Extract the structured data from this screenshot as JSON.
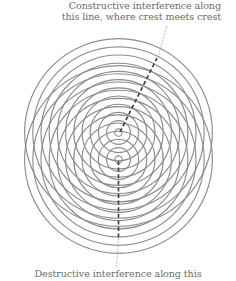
{
  "annotations": {
    "constructive": {
      "lines": [
        "Constructive interference along",
        "this line, where crest meets crest"
      ]
    },
    "destructive": {
      "lines": [
        "Destructive interference along this"
      ]
    }
  },
  "diagram": {
    "type": "two-source interference pattern",
    "sources": [
      {
        "name": "upper-source",
        "cx": 118.5,
        "cy": 132.5
      },
      {
        "name": "lower-source",
        "cx": 118.5,
        "cy": 159.5
      }
    ],
    "ring_count": 12,
    "ring_spacing": 8.2,
    "ring_color": "#8c8c8c",
    "dash_color": "#3a3a3a",
    "leader_color": "#9a9a9a"
  }
}
